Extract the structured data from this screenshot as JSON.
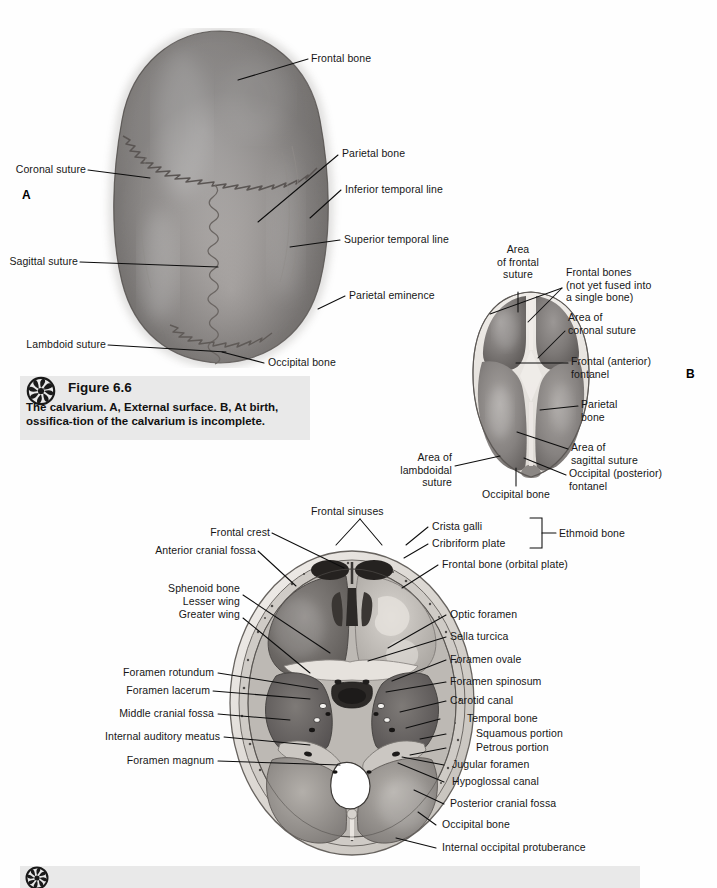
{
  "page": {
    "background": "#fefefe",
    "ink": "#161616"
  },
  "figure_a": {
    "panel_letter": "A",
    "labels": [
      {
        "text": "Frontal bone",
        "side": "right"
      },
      {
        "text": "Parietal bone",
        "side": "right"
      },
      {
        "text": "Inferior temporal line",
        "side": "right"
      },
      {
        "text": "Superior temporal line",
        "side": "right"
      },
      {
        "text": "Parietal eminence",
        "side": "right"
      },
      {
        "text": "Occipital bone",
        "side": "right"
      },
      {
        "text": "Coronal suture",
        "side": "left"
      },
      {
        "text": "Sagittal suture",
        "side": "left"
      },
      {
        "text": "Lambdoid suture",
        "side": "left"
      }
    ]
  },
  "figure_b": {
    "panel_letter": "B",
    "labels": [
      {
        "text": "Area\nof frontal\nsuture",
        "side": "top"
      },
      {
        "text": "Frontal bones\n(not yet fused into\na single bone)",
        "side": "right"
      },
      {
        "text": "Area of\ncoronal suture",
        "side": "right"
      },
      {
        "text": "Frontal (anterior)\nfontanel",
        "side": "right"
      },
      {
        "text": "Parietal\nbone",
        "side": "right"
      },
      {
        "text": "Area of\nsagittal suture",
        "side": "right"
      },
      {
        "text": "Occipital (posterior)\nfontanel",
        "side": "right"
      },
      {
        "text": "Occipital bone",
        "side": "bottom"
      },
      {
        "text": "Area of\nlambdoidal\nsuture",
        "side": "left"
      }
    ]
  },
  "figure_c": {
    "labels_left": [
      "Frontal sinuses",
      "Frontal crest",
      "Anterior cranial fossa",
      "Sphenoid bone",
      "Lesser wing",
      "Greater wing",
      "Foramen rotundum",
      "Foramen lacerum",
      "Middle cranial fossa",
      "Internal auditory meatus",
      "Foramen magnum"
    ],
    "labels_right": [
      "Crista galli",
      "Cribriform plate",
      "Ethmoid bone",
      "Frontal bone (orbital plate)",
      "Optic foramen",
      "Sella turcica",
      "Foramen ovale",
      "Foramen spinosum",
      "Carotid canal",
      "Temporal bone",
      "Squamous portion",
      "Petrous portion",
      "Jugular foramen",
      "Hypoglossal canal",
      "Posterior cranial fossa",
      "Occipital bone",
      "Internal occipital protuberance"
    ],
    "bracket_label": "Ethmoid bone"
  },
  "caption_1": {
    "icon": "rosette-icon",
    "figure_number": "Figure 6.6",
    "sentence_1_lead": "The calvarium. ",
    "sentence_1_a": "A,",
    "sentence_1_mid": " External surface. ",
    "sentence_1_b": "B,",
    "sentence_1_tail": "  At birth, ossifica-",
    "sentence_2": "tion of the calvarium is incomplete."
  },
  "caption_2": {
    "icon": "rosette-icon"
  }
}
